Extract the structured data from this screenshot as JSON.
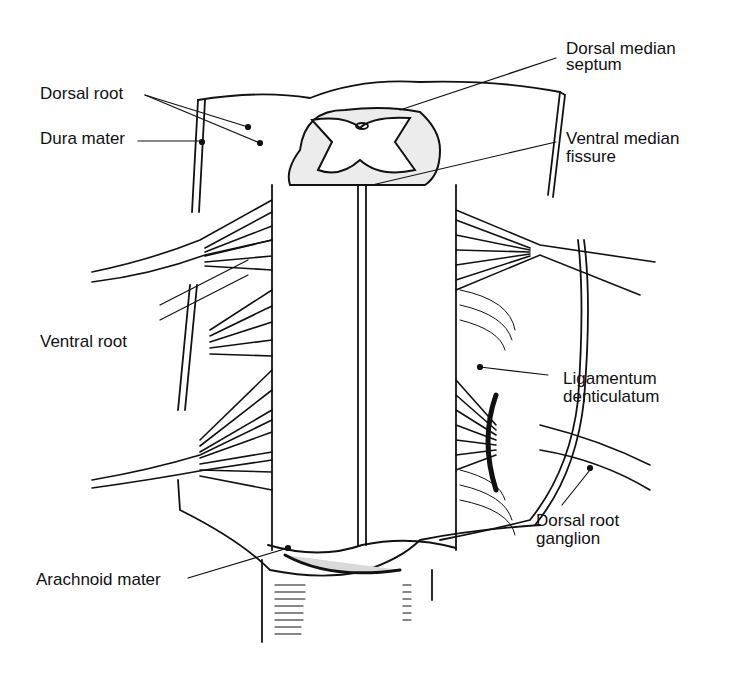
{
  "labels": {
    "dorsal_root": "Dorsal root",
    "dura_mater": "Dura mater",
    "dorsal_median_septum_1": "Dorsal median",
    "dorsal_median_septum_2": "septum",
    "ventral_median_fissure_1": "Ventral median",
    "ventral_median_fissure_2": "fissure",
    "ventral_root": "Ventral root",
    "ligamentum_1": "Ligamentum",
    "ligamentum_2": "denticulatum",
    "ganglion_1": "Dorsal root",
    "ganglion_2": "ganglion",
    "arachnoid_mater": "Arachnoid mater"
  },
  "colors": {
    "ink": "#111111",
    "background": "#ffffff",
    "stipple": "#e4e4e4"
  }
}
